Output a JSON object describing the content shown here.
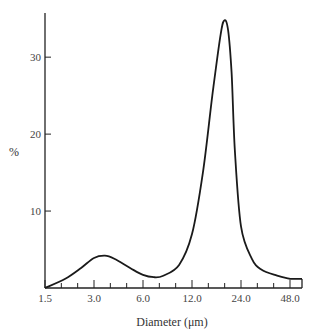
{
  "chart_data": {
    "type": "line",
    "title": "",
    "xlabel": "Diameter (μm)",
    "ylabel": "%",
    "x_scale": "log2",
    "x_tick_labels": [
      "1.5",
      "3.0",
      "6.0",
      "12.0",
      "24.0",
      "48.0"
    ],
    "x_ticks": [
      1.5,
      3.0,
      6.0,
      12.0,
      24.0,
      48.0
    ],
    "y_tick_labels": [
      "10",
      "20",
      "30"
    ],
    "y_ticks": [
      10,
      20,
      30
    ],
    "xlim": [
      1.5,
      48.0
    ],
    "ylim": [
      0,
      36
    ],
    "grid": false,
    "legend": null,
    "series": [
      {
        "name": "size distribution",
        "x": [
          1.5,
          2.0,
          2.5,
          3.0,
          3.5,
          4.0,
          5.0,
          6.0,
          7.0,
          8.0,
          10.0,
          12.0,
          14.0,
          16.0,
          18.0,
          19.0,
          20.0,
          21.0,
          22.0,
          24.0,
          28.0,
          32.0,
          40.0,
          48.0
        ],
        "values": [
          0,
          1.2,
          2.6,
          3.9,
          4.2,
          3.8,
          2.6,
          1.7,
          1.4,
          1.6,
          3.0,
          7.0,
          15.0,
          25.0,
          33.0,
          34.8,
          33.5,
          28.0,
          18.0,
          8.0,
          3.8,
          2.4,
          1.6,
          1.2
        ]
      }
    ],
    "annotations": []
  }
}
